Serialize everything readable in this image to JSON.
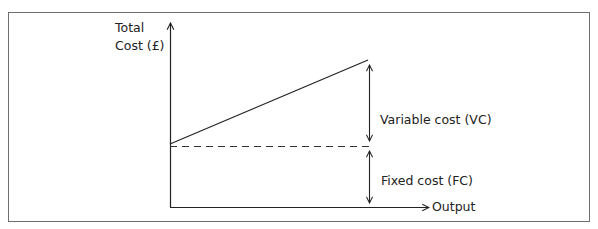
{
  "diagram": {
    "y_axis_label_line1": "Total",
    "y_axis_label_line2": "Cost (£)",
    "x_axis_label": "Output",
    "variable_cost_label": "Variable cost (VC)",
    "fixed_cost_label": "Fixed cost (FC)",
    "colors": {
      "line": "#222222",
      "frame": "#6e6e6e",
      "background": "#ffffff"
    }
  }
}
